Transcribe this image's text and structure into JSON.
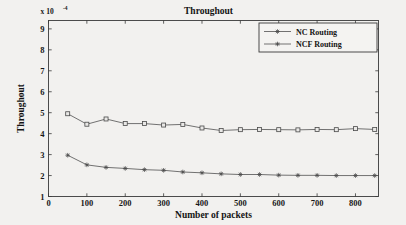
{
  "figure": {
    "title": "Throughout",
    "exponent_prefix": "x 10",
    "exponent_power": "-4",
    "xlabel": "Number of packets",
    "ylabel": "Throughout",
    "background_color": "#f2f1ef",
    "axis_color": "#3a3a3a",
    "line_color": "#5a5a5a"
  },
  "axes": {
    "x_ticks": [
      "0",
      "100",
      "200",
      "300",
      "400",
      "500",
      "600",
      "700",
      "800"
    ],
    "y_ticks": [
      "1",
      "2",
      "3",
      "4",
      "5",
      "6",
      "7",
      "8",
      "9"
    ]
  },
  "legend": {
    "position": "top-right",
    "entries": [
      {
        "label": "NC Routing",
        "marker": "star-marker"
      },
      {
        "label": "NCF Routing",
        "marker": "square-marker"
      }
    ]
  },
  "chart_data": {
    "type": "line",
    "title": "Throughout",
    "xlabel": "Number of packets",
    "ylabel": "Throughout",
    "y_scale_factor": 0.0001,
    "y_axis_exponent_label": "x 10^-4",
    "xlim": [
      0,
      860
    ],
    "ylim": [
      1,
      9.4
    ],
    "x_tick_values": [
      0,
      100,
      200,
      300,
      400,
      500,
      600,
      700,
      800
    ],
    "y_tick_values": [
      1,
      2,
      3,
      4,
      5,
      6,
      7,
      8,
      9
    ],
    "grid": false,
    "legend_position": "upper right",
    "x": [
      50,
      100,
      150,
      200,
      250,
      300,
      350,
      400,
      450,
      500,
      550,
      600,
      650,
      700,
      750,
      800,
      850
    ],
    "series": [
      {
        "name": "NC Routing",
        "marker": "star",
        "values": [
          2.97,
          2.51,
          2.39,
          2.34,
          2.28,
          2.25,
          2.17,
          2.13,
          2.08,
          2.05,
          2.05,
          2.02,
          2.01,
          2.01,
          2.0,
          2.0,
          2.0
        ]
      },
      {
        "name": "NCF Routing",
        "marker": "square",
        "values": [
          4.95,
          4.45,
          4.7,
          4.48,
          4.48,
          4.41,
          4.44,
          4.27,
          4.15,
          4.19,
          4.2,
          4.19,
          4.18,
          4.2,
          4.19,
          4.24,
          4.2
        ]
      }
    ]
  }
}
